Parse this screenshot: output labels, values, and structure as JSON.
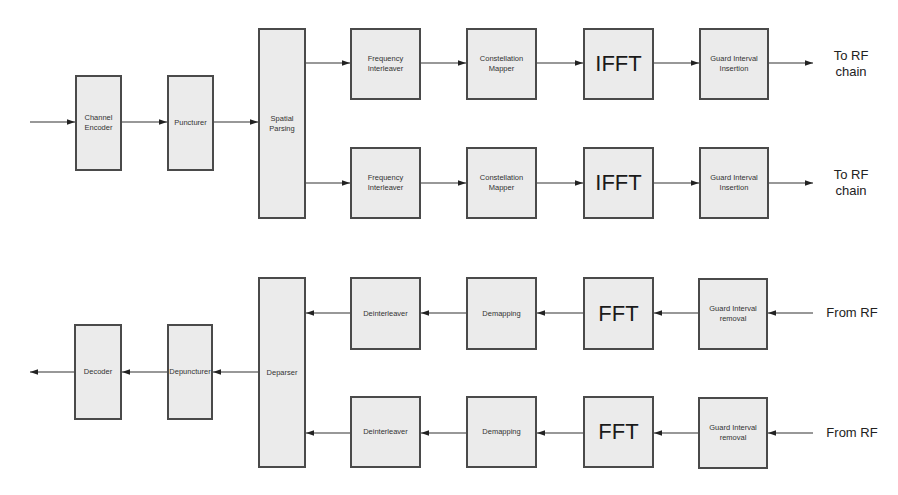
{
  "diagram": {
    "title": "",
    "colors": {
      "block_fill": "#ebebeb",
      "block_border": "#4a4a4a",
      "wire": "#333333",
      "text": "#333333"
    },
    "transmitter": {
      "input_arrow": {
        "from": [
          30,
          122
        ],
        "to": [
          75,
          122
        ]
      },
      "blocks": [
        {
          "id": "channel-encoder",
          "label": "Channel\nEncoder",
          "x": 75,
          "y": 75,
          "w": 47,
          "h": 96
        },
        {
          "id": "puncturer",
          "label": "Puncturer",
          "x": 167,
          "y": 75,
          "w": 47,
          "h": 96
        },
        {
          "id": "spatial-parsing",
          "label": "Spatial\nParsing",
          "x": 258,
          "y": 28,
          "w": 48,
          "h": 191
        }
      ],
      "streams": [
        {
          "y": 63,
          "blocks": [
            {
              "id": "frequency-interleaver-1",
              "label": "Frequency\nInterleaver",
              "x": 350,
              "y": 28,
              "w": 71,
              "h": 72
            },
            {
              "id": "constellation-mapper-1",
              "label": "Constellation\nMapper",
              "x": 466,
              "y": 28,
              "w": 71,
              "h": 72
            },
            {
              "id": "ifft-1",
              "label": "IFFT",
              "x": 583,
              "y": 28,
              "w": 71,
              "h": 72,
              "big": true
            },
            {
              "id": "guard-interval-insertion-1",
              "label": "Guard Interval\nInsertion",
              "x": 699,
              "y": 28,
              "w": 70,
              "h": 72
            }
          ],
          "output_label": "To RF\nchain"
        },
        {
          "y": 183,
          "blocks": [
            {
              "id": "frequency-interleaver-2",
              "label": "Frequency\nInterleaver",
              "x": 350,
              "y": 147,
              "w": 71,
              "h": 72
            },
            {
              "id": "constellation-mapper-2",
              "label": "Constellation\nMapper",
              "x": 466,
              "y": 147,
              "w": 71,
              "h": 72
            },
            {
              "id": "ifft-2",
              "label": "IFFT",
              "x": 583,
              "y": 147,
              "w": 71,
              "h": 72,
              "big": true
            },
            {
              "id": "guard-interval-insertion-2",
              "label": "Guard Interval\nInsertion",
              "x": 699,
              "y": 147,
              "w": 70,
              "h": 72
            }
          ],
          "output_label": "To RF\nchain"
        }
      ]
    },
    "receiver": {
      "output_arrow": {
        "from": [
          74,
          372
        ],
        "to": [
          30,
          372
        ]
      },
      "blocks": [
        {
          "id": "decoder",
          "label": "Decoder",
          "x": 74,
          "y": 324,
          "w": 48,
          "h": 96
        },
        {
          "id": "depuncturer",
          "label": "Depuncturer",
          "x": 167,
          "y": 324,
          "w": 46,
          "h": 96
        },
        {
          "id": "deparser",
          "label": "Deparser",
          "x": 258,
          "y": 277,
          "w": 48,
          "h": 191
        }
      ],
      "streams": [
        {
          "y": 313,
          "blocks": [
            {
              "id": "deinterleaver-1",
              "label": "Deinterleaver",
              "x": 350,
              "y": 277,
              "w": 71,
              "h": 73
            },
            {
              "id": "demapping-1",
              "label": "Demapping",
              "x": 466,
              "y": 277,
              "w": 71,
              "h": 73
            },
            {
              "id": "fft-1",
              "label": "FFT",
              "x": 583,
              "y": 277,
              "w": 71,
              "h": 73,
              "big": true
            },
            {
              "id": "guard-interval-removal-1",
              "label": "Guard Interval\nremoval",
              "x": 698,
              "y": 278,
              "w": 70,
              "h": 72
            }
          ],
          "input_label": "From RF"
        },
        {
          "y": 433,
          "blocks": [
            {
              "id": "deinterleaver-2",
              "label": "Deinterleaver",
              "x": 350,
              "y": 396,
              "w": 71,
              "h": 72
            },
            {
              "id": "demapping-2",
              "label": "Demapping",
              "x": 466,
              "y": 396,
              "w": 71,
              "h": 72
            },
            {
              "id": "fft-2",
              "label": "FFT",
              "x": 583,
              "y": 396,
              "w": 71,
              "h": 72,
              "big": true
            },
            {
              "id": "guard-interval-removal-2",
              "label": "Guard Interval\nremoval",
              "x": 698,
              "y": 397,
              "w": 70,
              "h": 72
            }
          ],
          "input_label": "From RF"
        }
      ]
    }
  }
}
